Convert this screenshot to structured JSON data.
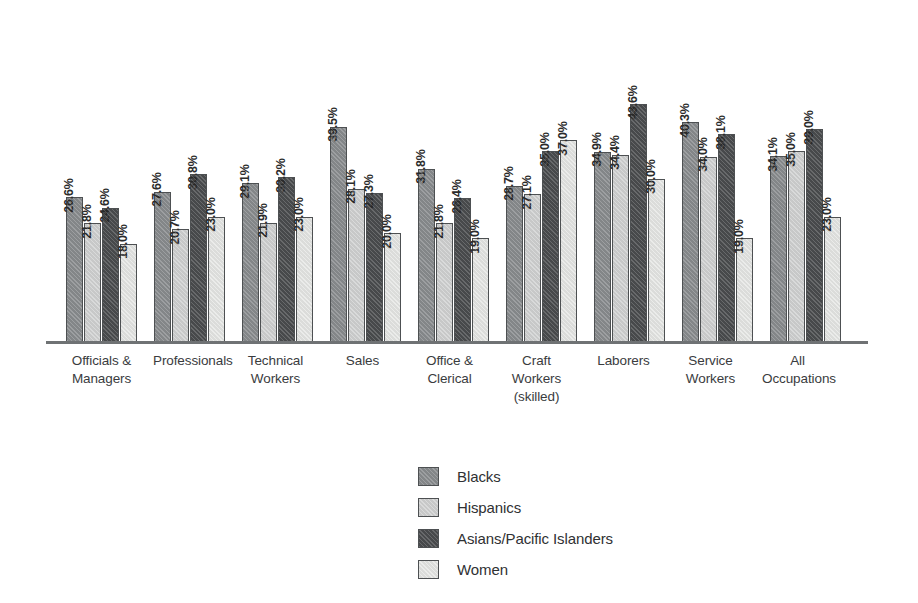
{
  "chart_data": {
    "type": "bar",
    "title": "",
    "subtitle": "",
    "xlabel": "",
    "ylabel": "",
    "ylim": [
      0,
      50
    ],
    "grid": false,
    "legend_position": "bottom-center",
    "value_label_suffix": "%",
    "value_labels_rotated": true,
    "categories": [
      [
        "Officials &",
        "Managers"
      ],
      [
        "Professionals"
      ],
      [
        "Technical",
        "Workers"
      ],
      [
        "Sales"
      ],
      [
        "Office &",
        "Clerical"
      ],
      [
        "Craft Workers",
        "(skilled)"
      ],
      [
        "Laborers"
      ],
      [
        "Service",
        "Workers"
      ],
      [
        "All",
        "Occupations"
      ]
    ],
    "category_labels": [
      "Officials & Managers",
      "Professionals",
      "Technical Workers",
      "Sales",
      "Office & Clerical",
      "Craft Workers (skilled)",
      "Laborers",
      "Service Workers",
      "All Occupations"
    ],
    "series": [
      {
        "name": "Blacks",
        "color": "#8a8d8f",
        "values": [
          26.6,
          27.6,
          29.1,
          39.5,
          31.8,
          28.7,
          34.9,
          40.3,
          34.1
        ],
        "labels": [
          "26.6%",
          "27.6%",
          "29.1%",
          "39.5%",
          "31.8%",
          "28.7%",
          "34.9%",
          "40.3%",
          "34.1%"
        ]
      },
      {
        "name": "Hispanics",
        "color": "#d2d3d3",
        "values": [
          21.8,
          20.7,
          21.9,
          28.1,
          21.8,
          27.1,
          34.4,
          34.0,
          35.0
        ],
        "labels": [
          "21.8%",
          "20.7%",
          "21.9%",
          "28.1%",
          "21.8%",
          "27.1%",
          "34.4%",
          "34.0%",
          "35.0%"
        ]
      },
      {
        "name": "Asians/Pacific Islanders",
        "color": "#4b4d4f",
        "values": [
          24.6,
          30.8,
          30.2,
          27.3,
          26.4,
          35.0,
          43.6,
          38.1,
          39.0
        ],
        "labels": [
          "24.6%",
          "30.8%",
          "30.2%",
          "27.3%",
          "26.4%",
          "35.0%",
          "43.6%",
          "38.1%",
          "39.0%"
        ]
      },
      {
        "name": "Women",
        "color": "#e7e8e6",
        "values": [
          18.0,
          23.0,
          23.0,
          20.0,
          19.0,
          37.0,
          30.0,
          19.0,
          23.0
        ],
        "labels": [
          "18.0%",
          "23.0%",
          "23.0%",
          "20.0%",
          "19.0%",
          "37.0%",
          "30.0%",
          "19.0%",
          "23.0%"
        ]
      }
    ]
  },
  "legend": {
    "items": [
      {
        "label": "Blacks",
        "color": "#8a8d8f"
      },
      {
        "label": "Hispanics",
        "color": "#d2d3d3"
      },
      {
        "label": "Asians/Pacific Islanders",
        "color": "#4b4d4f"
      },
      {
        "label": "Women",
        "color": "#e7e8e6"
      }
    ]
  },
  "axis": {
    "baseline_color": "#6f7274"
  }
}
